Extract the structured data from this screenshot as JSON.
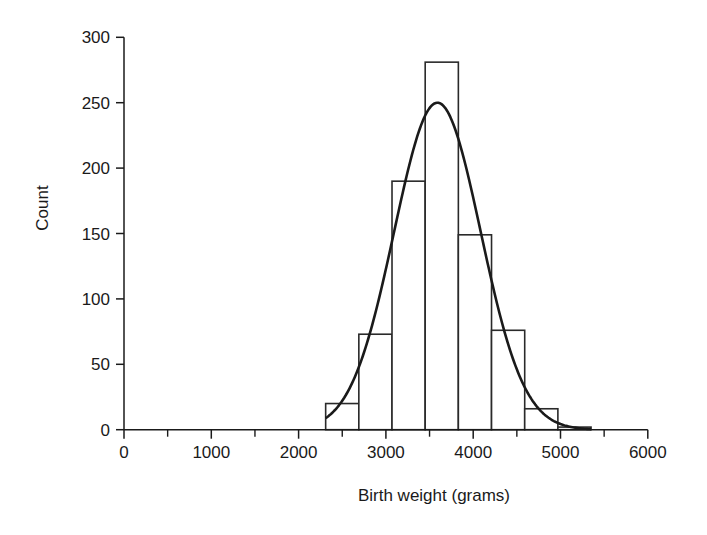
{
  "chart_data": {
    "type": "bar",
    "subtype": "histogram_with_normal_curve",
    "title": "",
    "xlabel": "Birth weight (grams)",
    "ylabel": "Count",
    "xlim": [
      0,
      6000
    ],
    "ylim": [
      0,
      300
    ],
    "xticks": [
      0,
      1000,
      2000,
      3000,
      4000,
      5000,
      6000
    ],
    "xtick_labels": [
      "0",
      "1000",
      "2000",
      "3000",
      "4000",
      "5000",
      "6000"
    ],
    "x_minor_ticks": [
      500,
      1500,
      2500,
      3500,
      4500,
      5500
    ],
    "yticks": [
      0,
      50,
      100,
      150,
      200,
      250,
      300
    ],
    "ytick_labels": [
      "0",
      "50",
      "100",
      "150",
      "200",
      "250",
      "300"
    ],
    "grid": false,
    "legend": null,
    "bin_edges": [
      2310,
      2690,
      3070,
      3450,
      3830,
      4210,
      4590,
      4970,
      5350
    ],
    "categories": [
      "2310-2690",
      "2690-3070",
      "3070-3450",
      "3450-3830",
      "3830-4210",
      "4210-4590",
      "4590-4970",
      "4970-5350"
    ],
    "values": [
      20,
      73,
      190,
      281,
      149,
      76,
      16,
      2
    ],
    "series": [
      {
        "name": "Count",
        "type": "bar",
        "values": [
          20,
          73,
          190,
          281,
          149,
          76,
          16,
          2
        ]
      },
      {
        "name": "Normal curve",
        "type": "line",
        "mean": 3590,
        "sd": 495,
        "peak": 250,
        "x_range": [
          2310,
          5350
        ]
      }
    ],
    "colors": {
      "bar_fill": "#ffffff",
      "bar_edge": "#2a2a2a",
      "curve": "#1a1a1a",
      "axis": "#1a1a1a"
    }
  }
}
